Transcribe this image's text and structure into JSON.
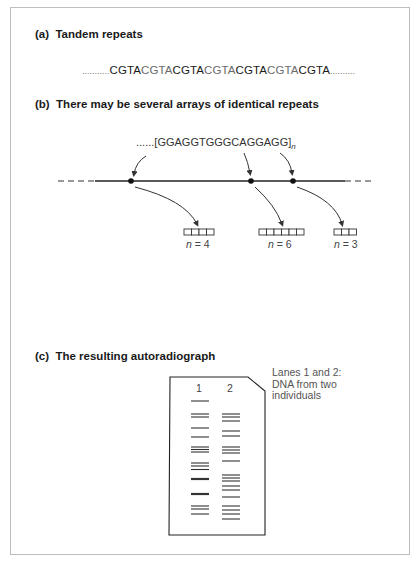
{
  "panels": {
    "a": {
      "label": "(a)",
      "title": "Tandem repeats",
      "sequence": {
        "leading_dots": "...........",
        "units": [
          "CGTA",
          "CGTA",
          "CGTA",
          "CGTA",
          "CGTA",
          "CGTA",
          "CGTA"
        ],
        "trailing_dots": ".........."
      }
    },
    "b": {
      "label": "(b)",
      "title": "There may be several arrays of identical repeats",
      "repeat_unit_prefix": "......",
      "repeat_unit": "[GGAGGTGGGCAGGAGG]",
      "repeat_subscript": "n",
      "arrays": [
        {
          "n_var": "n",
          "n_eq": " = 4",
          "boxes": 4
        },
        {
          "n_var": "n",
          "n_eq": " = 6",
          "boxes": 6
        },
        {
          "n_var": "n",
          "n_eq": " = 3",
          "boxes": 3
        }
      ]
    },
    "c": {
      "label": "(c)",
      "title": "The resulting autoradiograph",
      "lanes": [
        {
          "label": "1"
        },
        {
          "label": "2"
        }
      ],
      "note_lines": [
        "Lanes 1 and 2:",
        "DNA from two",
        "individuals"
      ]
    }
  },
  "colors": {
    "text": "#1a1a1a",
    "light_text": "#6a6a6a",
    "line": "#222222",
    "frame": "#bdbdbd"
  }
}
